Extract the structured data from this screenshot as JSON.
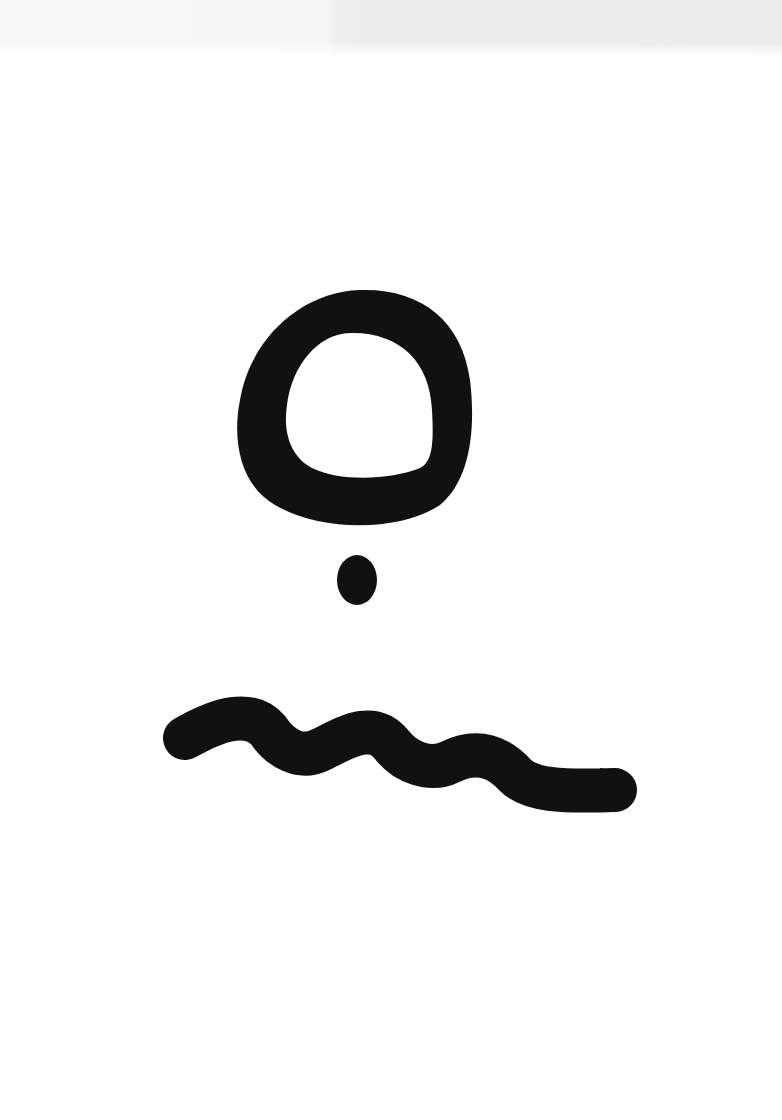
{
  "page": {
    "kind": "scanned page",
    "background_color": "#ffffff",
    "bleed_through_color": "#e9e9e9",
    "ink_color": "#111111"
  },
  "marks": [
    {
      "name": "ring",
      "description": "thick hand-painted ring"
    },
    {
      "name": "dot",
      "description": "small ink dot below ring"
    },
    {
      "name": "wave",
      "description": "wavy horizontal brush stroke"
    }
  ]
}
